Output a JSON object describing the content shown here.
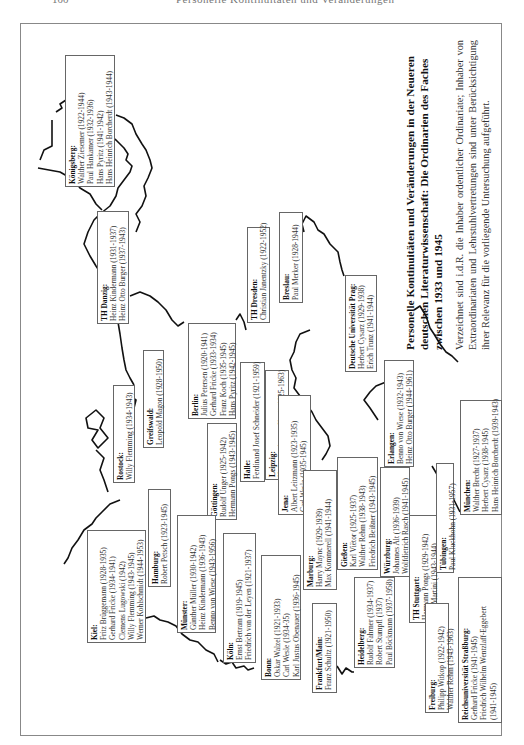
{
  "page": {
    "number": "100",
    "running_head": "Personelle Kontinuitäten und Veränderungen"
  },
  "caption": {
    "title": "Personelle Kontinuitäten und Veränderungen in der Neueren deutschen Literaturwissenschaft: Die Ordinarien des Faches zwischen 1933 und 1945",
    "body": "Verzeichnet sind i.d.R. die Inhaber ordentlicher Ordinariate; Inhaber von Extraordinariaten und Lehrstuhlvertretungen sind unter Berücksichtigung ihrer Relevanz für die vorliegende Untersuchung aufgeführt."
  },
  "universities": [
    {
      "id": "koenigsberg",
      "city": "Königsberg:",
      "entries": [
        "Walther Ziesemer (1922-1944)",
        "Paul Hankamer (1932-1936)",
        "Hans Pyritz (1941-1942)",
        "Hans Heinrich Borcherdt (1943-1944)"
      ],
      "box": [
        65,
        55,
        50,
        132
      ]
    },
    {
      "id": "danzig",
      "city": "TH Danzig:",
      "entries": [
        "Heinz Kindermann (1931-1937)",
        "Heinz Otto Burger (1937-1943)"
      ],
      "box": [
        97,
        211,
        32,
        113
      ]
    },
    {
      "id": "greifswald",
      "city": "Greifswald:",
      "entries": [
        "Leopold Magon (1928-1950)"
      ],
      "box": [
        143,
        350,
        21,
        98
      ]
    },
    {
      "id": "rostock",
      "city": "Rostock:",
      "entries": [
        "Willy Flemming (1934-1943)"
      ],
      "box": [
        113,
        385,
        22,
        98
      ]
    },
    {
      "id": "berlin",
      "city": "Berlin:",
      "entries": [
        "Julius Petersen (1920-1941)",
        "Gerhard Fricke (1933-1934)",
        "Franz Koch (1935-1945)",
        "Hans Pyritz (1942-1945)"
      ],
      "box": [
        188,
        323,
        48,
        96
      ]
    },
    {
      "id": "dresden",
      "city": "TH Dresden:",
      "entries": [
        "Christian Janentzky (1922-1952)"
      ],
      "box": [
        247,
        227,
        23,
        96
      ]
    },
    {
      "id": "breslau",
      "city": "Breslau:",
      "entries": [
        "Paul Merker (1928-1944)"
      ],
      "box": [
        279,
        212,
        24,
        91
      ]
    },
    {
      "id": "prag",
      "city": "Deutsche Universität Prag:",
      "entries": [
        "Herbert Cysarz (1929-1938)",
        "Erich Trunz (1941-1944)"
      ],
      "box": [
        345,
        275,
        32,
        97
      ]
    },
    {
      "id": "goettingen",
      "city": "Göttingen:",
      "entries": [
        "Rudolf Unger (1925-1942)",
        "Hermann Pongs (1943-1945)"
      ],
      "box": [
        207,
        423,
        30,
        97
      ]
    },
    {
      "id": "halle",
      "city": "Halle:",
      "entries": [
        "Ferdinand Josef Schneider (1921-1959)"
      ],
      "box": [
        240,
        362,
        25,
        120
      ]
    },
    {
      "id": "leipzig",
      "city": "Leipzig:",
      "entries": [
        "Hermann August Korff (1925-1963)"
      ],
      "box": [
        265,
        370,
        24,
        110
      ]
    },
    {
      "id": "jena",
      "city": "Jena:",
      "entries": [
        "Albert Leitzmann (1923-1935)",
        "Carl Wesle (1935-1945)"
      ],
      "box": [
        278,
        395,
        33,
        120
      ]
    },
    {
      "id": "hamburg",
      "city": "Hamburg:",
      "entries": [
        "Robert Petsch (1923-1945)"
      ],
      "box": [
        148,
        489,
        23,
        98
      ]
    },
    {
      "id": "kiel",
      "city": "Kiel:",
      "entries": [
        "Fritz Brüggemann (1928-1935)",
        "Gerhard Fricke (1934-1941)",
        "Clemens Lugowski (1942)",
        "Willy Flemming (1943-1945)",
        "Werner Kohlschmidt (1944-1953)"
      ],
      "box": [
        87,
        530,
        59,
        113
      ]
    },
    {
      "id": "muenster",
      "city": "Münster:",
      "entries": [
        "Günther Müller (1930-1942)",
        "Heinz Kindermann (1936-1943)",
        "Benno von Wiese (1943-1956)"
      ],
      "box": [
        177,
        515,
        39,
        118
      ]
    },
    {
      "id": "koeln",
      "city": "Köln:",
      "entries": [
        "Ernst Bertram (1919-1945)",
        "Friedrich von der Leyen (1921-1937)"
      ],
      "box": [
        223,
        533,
        33,
        130
      ]
    },
    {
      "id": "bonn",
      "city": "Bonn:",
      "entries": [
        "Oskar Walzel (1921-1933)",
        "Carl Wesle (1934-35)",
        "Karl Justus Obenauer (1936-1945)"
      ],
      "box": [
        261,
        555,
        40,
        125
      ]
    },
    {
      "id": "marburg",
      "city": "Marburg:",
      "entries": [
        "Harry Maync (1929-1939)",
        "Max Kommerell (1941-1944)"
      ],
      "box": [
        303,
        470,
        34,
        120
      ]
    },
    {
      "id": "frankfurt",
      "city": "Frankfurt/Main:",
      "entries": [
        "Franz Schultz (1921-1950)"
      ],
      "box": [
        312,
        603,
        25,
        90
      ]
    },
    {
      "id": "giessen",
      "city": "Gießen:",
      "entries": [
        "Karl Viëtor (1925-1937)",
        "Walther Rehm (1938-1943)",
        "Friedrich Beißner (1943-1945)"
      ],
      "box": [
        337,
        457,
        41,
        113
      ]
    },
    {
      "id": "erlangen",
      "city": "Erlangen:",
      "entries": [
        "Benno von Wiese (1932-1943)",
        "Heinz Otto Burger (1944-1961)"
      ],
      "box": [
        384,
        360,
        30,
        107
      ]
    },
    {
      "id": "wuerzburg",
      "city": "Würzburg:",
      "entries": [
        "Johannes Alt (1936-1939)",
        "Wolfdietrich Rasch (1941-1945)"
      ],
      "box": [
        380,
        467,
        30,
        110
      ]
    },
    {
      "id": "heidelberg",
      "city": "Heidelberg:",
      "entries": [
        "Rudolf Fahrner (1934-1937)",
        "Robert Stumpfl (1937)",
        "Paul Böckmann (1937-1958)"
      ],
      "box": [
        354,
        577,
        41,
        91
      ]
    },
    {
      "id": "stuttgart",
      "city": "TH Stuttgart:",
      "entries": [
        "Hermann Pongs (1929-1942)",
        "Fritz Martini (1943-1944)"
      ],
      "box": [
        409,
        515,
        28,
        108
      ]
    },
    {
      "id": "tuebingen",
      "city": "Tübingen:",
      "entries": [
        "Paul Kluckhohn (1931-1957)"
      ],
      "box": [
        436,
        463,
        18,
        110
      ]
    },
    {
      "id": "muenchen",
      "city": "München:",
      "entries": [
        "Walther Brecht (1927-1937)",
        "Herbert Cysarz (1938-1945)",
        "Hans Heinrich Borcherdt (1939-1943)"
      ],
      "box": [
        460,
        400,
        42,
        115
      ]
    },
    {
      "id": "freiburg",
      "city": "Freiburg:",
      "entries": [
        "Philipp Witkop (1922-1942)",
        "Walther Rehm (1943-1963)"
      ],
      "box": [
        425,
        603,
        24,
        110
      ]
    },
    {
      "id": "strassburg",
      "city": "Reichsuniversität Straßburg:",
      "entries": [
        "Gerhard Fricke (1941-1945)",
        "Friedrich Wilhelm Wentzlaff-Eggebert",
        "(1941-1945)"
      ],
      "box": [
        458,
        577,
        44,
        146
      ]
    }
  ]
}
